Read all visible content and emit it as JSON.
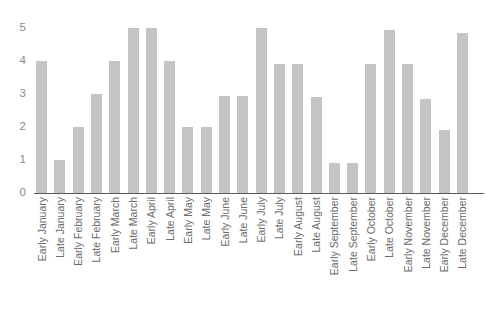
{
  "chart_data": {
    "type": "bar",
    "title": "",
    "subtitle": "",
    "xlabel": "",
    "ylabel": "",
    "ylim": [
      0,
      5
    ],
    "yticks": [
      0,
      1,
      2,
      3,
      4,
      5
    ],
    "ytick_labels": [
      "0",
      "1",
      "2",
      "3",
      "4",
      "5"
    ],
    "grid": false,
    "legend": null,
    "bar_color": "#c4c4c4",
    "axis_color": "#595959",
    "tick_label_color": "#8a8a8a",
    "categories": [
      "Early January",
      "Late January",
      "Early February",
      "Late February",
      "Early March",
      "Late March",
      "Early April",
      "Late April",
      "Early May",
      "Late May",
      "Early June",
      "Late June",
      "Early July",
      "Late July",
      "Early August",
      "Late August",
      "Early September",
      "Late September",
      "Early October",
      "Late October",
      "Early November",
      "Late November",
      "Early December",
      "Late December"
    ],
    "values": [
      4.0,
      1.0,
      2.0,
      3.0,
      4.0,
      5.0,
      5.0,
      4.0,
      2.0,
      2.0,
      2.95,
      2.95,
      5.0,
      3.9,
      3.9,
      2.9,
      0.9,
      0.9,
      3.9,
      4.95,
      3.9,
      2.85,
      1.9,
      4.85
    ]
  }
}
